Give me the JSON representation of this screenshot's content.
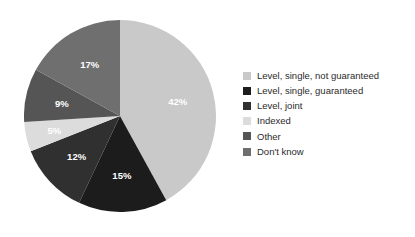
{
  "chart_data": {
    "type": "pie",
    "title": "",
    "subtitle": "",
    "xlabel": "",
    "ylabel": "",
    "grid": false,
    "legend_position": "right",
    "start_angle_deg": 0,
    "direction": "clockwise",
    "categories": [
      "Level, single, not guaranteed",
      "Level, single, guaranteed",
      "Level, joint",
      "Indexed",
      "Other",
      "Don't know"
    ],
    "values": [
      42,
      15,
      12,
      5,
      9,
      17
    ],
    "data_labels": [
      "42%",
      "15%",
      "12%",
      "5%",
      "9%",
      "17%"
    ],
    "colors": [
      "#c9c9c9",
      "#1c1c1c",
      "#303030",
      "#dcdcdc",
      "#555555",
      "#6f6f6f"
    ],
    "label_colors": [
      "#ffffff",
      "#ffffff",
      "#ffffff",
      "#ffffff",
      "#ffffff",
      "#ffffff"
    ],
    "units": "percent",
    "total": 100
  },
  "legend": {
    "items": [
      {
        "label": "Level, single, not guaranteed",
        "color": "#c9c9c9"
      },
      {
        "label": "Level, single, guaranteed",
        "color": "#1c1c1c"
      },
      {
        "label": "Level, joint",
        "color": "#303030"
      },
      {
        "label": "Indexed",
        "color": "#dcdcdc"
      },
      {
        "label": "Other",
        "color": "#555555"
      },
      {
        "label": "Don't know",
        "color": "#6f6f6f"
      }
    ]
  },
  "colors": {
    "background": "#ffffff",
    "legend_text": "#2b2b2b",
    "slice_label_text": "#ffffff"
  }
}
